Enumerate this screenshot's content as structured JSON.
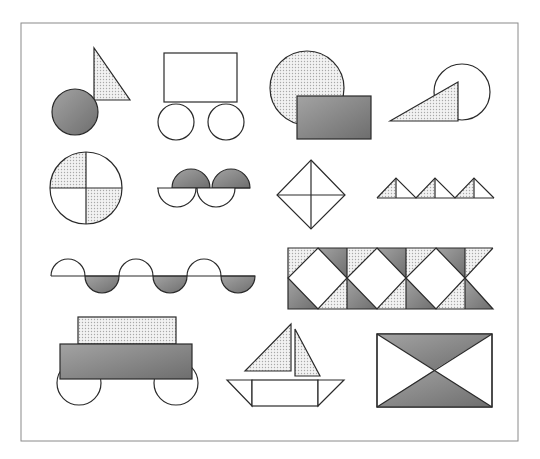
{
  "figure": {
    "colors": {
      "frame": "#8a8a8a",
      "outline": "#2a2a2a",
      "light_fill": "#e4e4e4",
      "dark_fill": "#8f8f8f",
      "blank_fill": "#ffffff"
    },
    "shapes": [
      {
        "id": "circle-and-triangle",
        "parts": [
          "dark circle",
          "light right triangle"
        ]
      },
      {
        "id": "cart-rectangle-two-wheels",
        "parts": [
          "rectangle",
          "circle",
          "circle"
        ]
      },
      {
        "id": "circle-behind-rectangle",
        "parts": [
          "light circle",
          "dark rectangle"
        ]
      },
      {
        "id": "triangle-over-circle",
        "parts": [
          "circle",
          "light right triangle"
        ]
      },
      {
        "id": "quartered-circle",
        "parts": [
          "2 light quarters",
          "2 blank quarters"
        ]
      },
      {
        "id": "interlocking-semicircles",
        "parts": [
          "2 dark top semicircles",
          "2 blank bottom semicircles"
        ]
      },
      {
        "id": "diamond-four-triangles",
        "parts": [
          "4 triangles"
        ]
      },
      {
        "id": "triangle-row",
        "parts": [
          "3 light half-triangles",
          "3 blank half-triangles"
        ]
      },
      {
        "id": "wave-semicircles",
        "parts": [
          "3 blank top semicircles",
          "3 dark bottom semicircles"
        ]
      },
      {
        "id": "diamond-band-pattern",
        "parts": [
          "3 blank diamonds",
          "light and dark corner triangles"
        ]
      },
      {
        "id": "wagon",
        "parts": [
          "light top rectangle",
          "dark base rectangle",
          "2 wheels"
        ]
      },
      {
        "id": "sailboat",
        "parts": [
          "2 light sails",
          "hull rectangle",
          "2 hull triangles"
        ]
      },
      {
        "id": "hourglass-rectangle",
        "parts": [
          "2 dark triangles",
          "2 blank triangles"
        ]
      }
    ]
  }
}
